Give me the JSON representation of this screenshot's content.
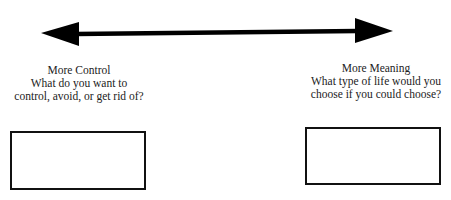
{
  "diagram": {
    "arrow": {
      "type": "double-headed",
      "color": "#000000"
    },
    "left": {
      "title": "More Control",
      "line1": "What do you want to",
      "line2": "control, avoid, or get rid of?",
      "answer_box": ""
    },
    "right": {
      "title": "More Meaning",
      "line1": "What type of life would you",
      "line2": "choose if you could choose?",
      "answer_box": ""
    }
  }
}
